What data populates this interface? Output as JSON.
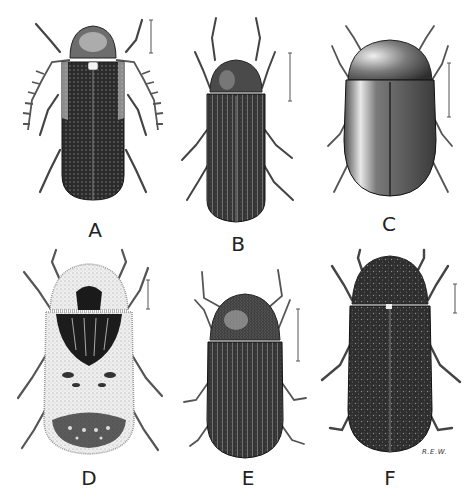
{
  "figure": {
    "type": "scientific-illustration-plate",
    "background": "#ffffff",
    "specimens": [
      {
        "label": "A",
        "body_shape": "elongate",
        "texture": "punctate-striate",
        "antennae": "serrate",
        "tone": "#2a2a2a"
      },
      {
        "label": "B",
        "body_shape": "elongate",
        "texture": "striate",
        "antennae": "filiform",
        "tone": "#3a3a3a"
      },
      {
        "label": "C",
        "body_shape": "oval",
        "texture": "smooth-shiny",
        "antennae": "filiform",
        "tone": "#555555"
      },
      {
        "label": "D",
        "body_shape": "oblong",
        "texture": "hairy-patterned",
        "antennae": "filiform",
        "tone": "#e0e0e0"
      },
      {
        "label": "E",
        "body_shape": "oval-elongate",
        "texture": "striate-hairy",
        "antennae": "filiform",
        "tone": "#444444"
      },
      {
        "label": "F",
        "body_shape": "oblong",
        "texture": "mottled-hairy",
        "antennae": "filiform",
        "tone": "#2e2e2e"
      }
    ],
    "signature": "R.E.W."
  }
}
